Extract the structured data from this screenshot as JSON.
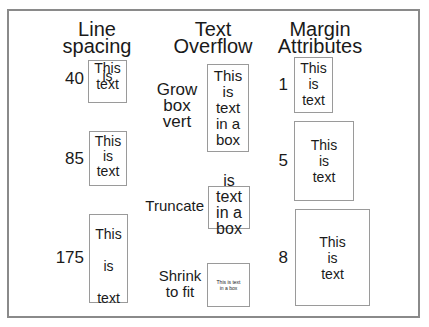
{
  "headings": {
    "line_spacing": [
      "Line",
      "spacing"
    ],
    "text_overflow": [
      "Text",
      "Overflow"
    ],
    "margin_attributes": [
      "Margin",
      "Attributes"
    ]
  },
  "line_spacing": [
    {
      "value": "40",
      "lines": [
        "This",
        "is",
        "text"
      ]
    },
    {
      "value": "85",
      "lines": [
        "This",
        "is",
        "text"
      ]
    },
    {
      "value": "175",
      "lines": [
        "This",
        "is",
        "text"
      ]
    }
  ],
  "text_overflow": [
    {
      "label": [
        "Grow",
        "box",
        "vert"
      ],
      "lines": [
        "This",
        "is",
        "text",
        "in a",
        "box"
      ]
    },
    {
      "label": [
        "Truncate"
      ],
      "lines": [
        "is",
        "text",
        "in a",
        "box"
      ]
    },
    {
      "label": [
        "Shrink",
        "to fit"
      ],
      "lines": [
        "This is text",
        "in a box"
      ]
    }
  ],
  "margin_attributes": [
    {
      "value": "1",
      "lines": [
        "This",
        "is",
        "text"
      ]
    },
    {
      "value": "5",
      "lines": [
        "This",
        "is",
        "text"
      ]
    },
    {
      "value": "8",
      "lines": [
        "This",
        "is",
        "text"
      ]
    }
  ],
  "colors": {
    "frame_border": "#8a8a8a",
    "box_border": "#9a9a9a",
    "text": "#1a1a1a"
  }
}
